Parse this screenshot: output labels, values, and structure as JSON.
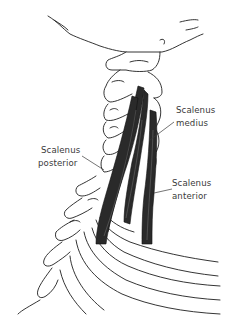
{
  "figure": {
    "line_color": "#1e1e1e",
    "muscle_color": "#2a2a2a",
    "background": "#ffffff"
  },
  "labels": {
    "medius": {
      "line1": "Scalenus",
      "line2": "medius"
    },
    "posterior": {
      "line1": "Scalenus",
      "line2": "posterior"
    },
    "anterior": {
      "line1": "Scalenus",
      "line2": "anterior"
    }
  }
}
